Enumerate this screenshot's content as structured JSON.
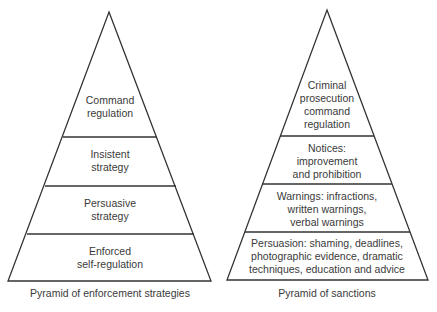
{
  "colors": {
    "line": "#333333",
    "text": "#3a3a3a",
    "background": "#ffffff"
  },
  "left_pyramid": {
    "caption": "Pyramid of enforcement strategies",
    "tiers": [
      {
        "lines": [
          "Command",
          "regulation"
        ]
      },
      {
        "lines": [
          "Insistent",
          "strategy"
        ]
      },
      {
        "lines": [
          "Persuasive",
          "strategy"
        ]
      },
      {
        "lines": [
          "Enforced",
          "self-regulation"
        ]
      }
    ]
  },
  "right_pyramid": {
    "caption": "Pyramid of sanctions",
    "tiers": [
      {
        "lines": [
          "Criminal",
          "prosecution",
          "command",
          "regulation"
        ]
      },
      {
        "lines": [
          "Notices:",
          "improvement",
          "and prohibition"
        ]
      },
      {
        "lines": [
          "Warnings: infractions,",
          "written warnings,",
          "verbal warnings"
        ]
      },
      {
        "lines": [
          "Persuasion: shaming, deadlines,",
          "photographic evidence, dramatic",
          "techniques, education and advice"
        ]
      }
    ]
  }
}
